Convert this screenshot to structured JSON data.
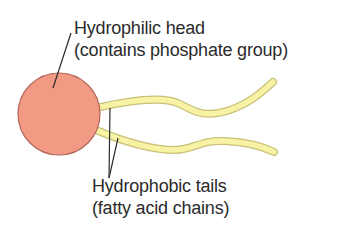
{
  "diagram": {
    "head": {
      "label_line1": "Hydrophilic head",
      "label_line2": "(contains phosphate group)",
      "fill": "#f39a84",
      "stroke": "#b0675a"
    },
    "tails": {
      "label_line1": "Hydrophobic tails",
      "label_line2": "(fatty acid chains)",
      "fill": "#f8f3a4",
      "stroke": "#c9c07a"
    },
    "leader_color": "#2b2b2b"
  }
}
